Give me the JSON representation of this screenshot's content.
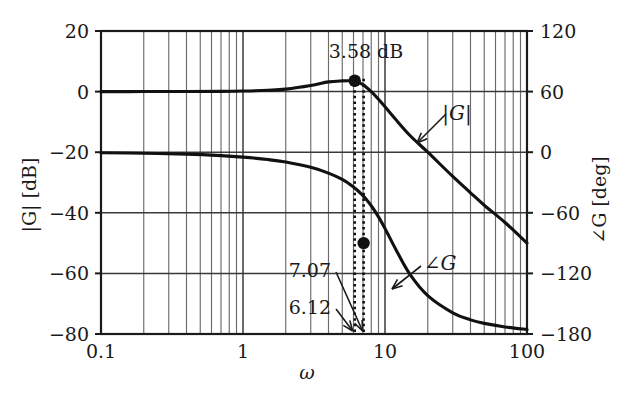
{
  "figure": {
    "kind": "bode-plot",
    "background": "#ffffff",
    "ink": "#1a1a1a",
    "grid_color": "#555555"
  },
  "axes": {
    "x": {
      "label": "ω",
      "scale": "log",
      "min": 0.1,
      "max": 100,
      "tick_labels": [
        "0.1",
        "1",
        "100"
      ],
      "tick_values": [
        0.1,
        1,
        100
      ],
      "minor_ticks": [
        2,
        3,
        4,
        5,
        6,
        7,
        8,
        9
      ]
    },
    "y_left": {
      "label": "|G|  [dB]",
      "label_parts": {
        "symbol": "|G|",
        "unit": "[dB]"
      },
      "min": -80,
      "max": 20,
      "tick_labels": [
        "20",
        "0",
        "−20",
        "−40",
        "−60",
        "−80"
      ],
      "tick_values": [
        20,
        0,
        -20,
        -40,
        -60,
        -80
      ]
    },
    "y_right": {
      "label": "∠G  [deg]",
      "label_parts": {
        "symbol": "∠G",
        "unit": "[deg]"
      },
      "min": -180,
      "max": 120,
      "tick_labels": [
        "120",
        "60",
        "0",
        "−60",
        "−120",
        "−180"
      ],
      "tick_values": [
        120,
        60,
        0,
        -60,
        -120,
        -180
      ]
    }
  },
  "annotations": {
    "peak_label": "3.58 dB",
    "resonant_freq_label": "7.07",
    "damped_freq_label": "6.12",
    "magnitude_curve_label": "|G|",
    "phase_curve_label": "∠G"
  },
  "markers": [
    {
      "name": "magnitude-peak-marker",
      "omega": 6.12,
      "value_db": 3.58
    },
    {
      "name": "phase-marker",
      "omega": 7.07,
      "value_deg": -90
    }
  ],
  "dotted_guides": [
    {
      "name": "guide-6-12",
      "omega": 6.12
    },
    {
      "name": "guide-7-07",
      "omega": 7.07
    }
  ],
  "chart_data": {
    "type": "line",
    "title": "",
    "subtitle": "",
    "xlabel": "ω",
    "ylabel": "|G|  [dB]",
    "y2label": "∠G  [deg]",
    "xscale": "log",
    "xlim": [
      0.1,
      100
    ],
    "ylim": [
      -80,
      20
    ],
    "y2lim": [
      -180,
      120
    ],
    "grid": true,
    "legend": "inline-annotations",
    "system": {
      "description": "second-order low-pass, unity DC gain",
      "natural_frequency": 7.07,
      "damping_ratio": 0.3,
      "peak_gain_db": 3.58,
      "peak_frequency": 6.12
    },
    "series": [
      {
        "name": "|G|",
        "axis": "left",
        "units": "dB",
        "x": [
          0.1,
          0.2,
          0.4,
          0.7,
          1,
          1.5,
          2,
          3,
          4,
          5,
          6,
          6.12,
          7,
          7.07,
          8,
          9,
          10,
          12,
          15,
          20,
          30,
          40,
          50,
          70,
          100
        ],
        "y": [
          0.0,
          0.01,
          0.03,
          0.09,
          0.19,
          0.44,
          0.81,
          2.0,
          3.2,
          3.55,
          3.58,
          3.58,
          2.3,
          2.2,
          0.0,
          -2.5,
          -5.0,
          -9.4,
          -14.5,
          -20.0,
          -28.0,
          -33.4,
          -37.5,
          -43.2,
          -50.0
        ]
      },
      {
        "name": "∠G",
        "axis": "right",
        "units": "deg",
        "x": [
          0.1,
          0.2,
          0.4,
          0.7,
          1,
          1.5,
          2,
          3,
          4,
          5,
          6,
          7,
          7.07,
          8,
          9,
          10,
          12,
          15,
          20,
          30,
          40,
          50,
          70,
          100
        ],
        "y": [
          -0.5,
          -1.0,
          -1.9,
          -3.4,
          -4.9,
          -7.3,
          -9.8,
          -15.0,
          -20.7,
          -27.0,
          -34.4,
          -42.9,
          -43.6,
          -53.0,
          -64.0,
          -75.5,
          -97.0,
          -121.0,
          -142.0,
          -159.0,
          -166.0,
          -169.5,
          -173.0,
          -175.5
        ]
      }
    ],
    "second_series_note": "∠G passes −90° at ω = 7.07"
  }
}
